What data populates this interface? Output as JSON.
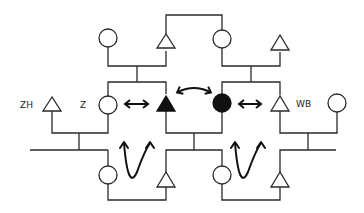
{
  "diagram": {
    "type": "pedigree",
    "labels": {
      "zh": "ZH",
      "z": "Z",
      "wb": "WB"
    },
    "symbols": {
      "open_circle": "female",
      "open_triangle": "male-or-unknown",
      "filled_triangle": "affected-triangle",
      "filled_circle": "affected-circle"
    },
    "generations": [
      {
        "name": "top",
        "members": [
          "circle",
          "triangle",
          "circle",
          "triangle"
        ]
      },
      {
        "name": "middle",
        "members": [
          "triangle ZH",
          "circle Z",
          "filled-triangle",
          "filled-circle",
          "triangle WB",
          "circle"
        ]
      },
      {
        "name": "bottom",
        "members": [
          "circle",
          "triangle",
          "circle",
          "triangle"
        ]
      }
    ],
    "relations": [
      "double-headed arrow between Z and filled triangle",
      "curved double-headed arrow between filled triangle and filled circle",
      "double-headed arrow between filled circle and WB",
      "U-shaped double arrow between left bottom-generation and middle",
      "U-shaped double arrow between right bottom-generation and middle"
    ]
  }
}
